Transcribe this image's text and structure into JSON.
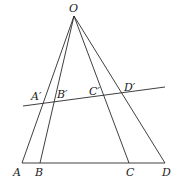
{
  "diagram": {
    "title": "",
    "points": {
      "O": {
        "label": "O",
        "x": 74,
        "y": 16
      },
      "A": {
        "label": "A",
        "x": 22,
        "y": 163
      },
      "B": {
        "label": "B",
        "x": 40,
        "y": 163
      },
      "C": {
        "label": "C",
        "x": 129,
        "y": 163
      },
      "D": {
        "label": "D",
        "x": 165,
        "y": 163
      },
      "A1": {
        "label": "A′",
        "x": 42,
        "y": 102
      },
      "B1": {
        "label": "B′",
        "x": 55,
        "y": 100
      },
      "C1": {
        "label": "C′",
        "x": 104,
        "y": 96
      },
      "D1": {
        "label": "D′",
        "x": 121,
        "y": 92
      }
    },
    "segments": [
      [
        "O",
        "A"
      ],
      [
        "O",
        "B"
      ],
      [
        "O",
        "C"
      ],
      [
        "O",
        "D"
      ],
      [
        "A",
        "D"
      ],
      [
        "T1",
        "T2"
      ]
    ],
    "transversal": {
      "x1": 23,
      "y1": 106,
      "x2": 165,
      "y2": 87
    }
  }
}
